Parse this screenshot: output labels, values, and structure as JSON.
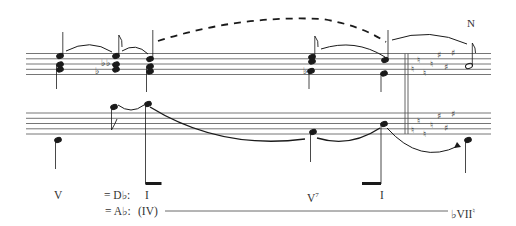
{
  "figure": {
    "type": "music-analysis-reduction",
    "staves": [
      "treble",
      "bass"
    ],
    "key_change": {
      "naturals": 6,
      "sharps": 4,
      "description": "cancellation naturals followed by four sharps (E major) after double barline"
    },
    "annotations": {
      "note_letter": "N"
    },
    "roman_numerals_row1": [
      {
        "label": "V",
        "x": 62
      },
      {
        "label": "= D♭:",
        "x": 105
      },
      {
        "label": "I",
        "x": 145
      },
      {
        "label": "V",
        "sup": "7",
        "x": 310
      },
      {
        "label": "I",
        "x": 380
      }
    ],
    "roman_numerals_row2": [
      {
        "label": "= A♭:",
        "x": 106
      },
      {
        "label": "(IV)",
        "x": 140
      },
      {
        "label": "♭VII",
        "sup": "♮",
        "x": 458
      }
    ]
  },
  "colors": {
    "ink": "#1a1a1a",
    "staff": "#555555",
    "text": "#333333"
  }
}
